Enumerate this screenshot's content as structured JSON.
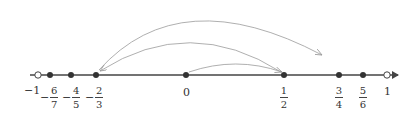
{
  "number_line": {
    "axis_color": "#444444",
    "arc_color": "#9a9a9a",
    "points": [
      {
        "value": "-1",
        "type": "open"
      },
      {
        "value": "-6/7",
        "type": "filled"
      },
      {
        "value": "-4/5",
        "type": "filled"
      },
      {
        "value": "-2/3",
        "type": "filled"
      },
      {
        "value": "0",
        "type": "filled"
      },
      {
        "value": "1/2",
        "type": "filled"
      },
      {
        "value": "3/4",
        "type": "filled"
      },
      {
        "value": "5/6",
        "type": "filled"
      },
      {
        "value": "1",
        "type": "open"
      }
    ],
    "labels": {
      "neg_one": "−1",
      "neg_six_sevenths": {
        "sign": "−",
        "num": "6",
        "den": "7"
      },
      "neg_four_fifths": {
        "sign": "−",
        "num": "4",
        "den": "5"
      },
      "neg_two_thirds": {
        "sign": "−",
        "num": "2",
        "den": "3"
      },
      "zero": "0",
      "one_half": {
        "num": "1",
        "den": "2"
      },
      "three_quarters": {
        "num": "3",
        "den": "4"
      },
      "five_sixths": {
        "num": "5",
        "den": "6"
      },
      "one": "1"
    },
    "arcs": [
      {
        "from": "0",
        "to": "1/2"
      },
      {
        "from": "1/2",
        "to": "-2/3"
      },
      {
        "from": "-2/3",
        "to": "3/4"
      }
    ]
  }
}
